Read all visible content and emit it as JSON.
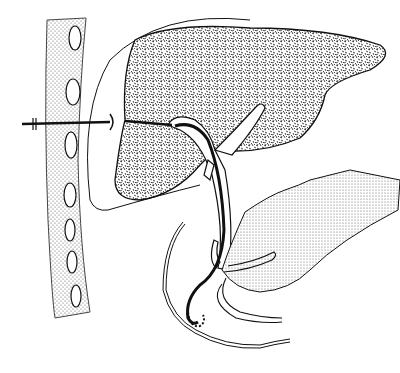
{
  "figure": {
    "kind": "medical line illustration",
    "labels": [],
    "colors": {
      "background": "#ffffff",
      "stroke": "#111111",
      "liver_fill": "#8a8a8a",
      "wall_fill": "#d8d8d8",
      "duodenum_fill": "#dcdcdc"
    },
    "parts": [
      {
        "name": "abdominal-wall",
        "description": "dotted vertical band with oval rib cross-sections"
      },
      {
        "name": "needle",
        "description": "catheter entering through abdominal wall, break marks at left"
      },
      {
        "name": "liver",
        "description": "speckled liver parenchyma"
      },
      {
        "name": "bile-ducts",
        "description": "intrahepatic and common bile duct"
      },
      {
        "name": "drainage-catheter",
        "description": "catheter through bile duct ending in pigtail loop in duodenum"
      },
      {
        "name": "pancreas-duodenum",
        "description": "dotted shaded organ at lower right"
      },
      {
        "name": "duodenum-outline",
        "description": "curved double outline at bottom"
      }
    ]
  }
}
